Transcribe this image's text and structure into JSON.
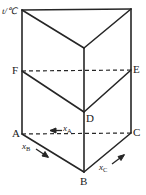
{
  "figure": {
    "name": "ternary-phase-prism",
    "type": "diagram",
    "width": 146,
    "height": 195,
    "background_color": "#ffffff",
    "line_color": "#262626",
    "text_color": "#1a1a1a"
  },
  "axis": {
    "temperature_label": "t/℃"
  },
  "vertices": {
    "A": "A",
    "B": "B",
    "C": "C",
    "D": "D",
    "E": "E",
    "F": "F"
  },
  "composition_axes": [
    {
      "id": "x-a",
      "symbol": "x",
      "subscript": "A",
      "arrow": "←",
      "arrow_direction": "left",
      "along": "C→A"
    },
    {
      "id": "x-b",
      "symbol": "x",
      "subscript": "B",
      "arrow": "↘",
      "arrow_direction": "down-right",
      "along": "A→B"
    },
    {
      "id": "x-c",
      "symbol": "x",
      "subscript": "C",
      "arrow": "↗",
      "arrow_direction": "up-right",
      "along": "B→C"
    }
  ],
  "geometry": {
    "top_left": [
      22,
      10
    ],
    "top_right": [
      131,
      9
    ],
    "top_front": [
      84,
      48
    ],
    "mid_left_F": [
      22,
      71
    ],
    "mid_right_E": [
      131,
      70
    ],
    "mid_front_D": [
      84,
      112
    ],
    "base_left_A": [
      22,
      134
    ],
    "base_right_C": [
      131,
      133
    ],
    "base_front_B": [
      84,
      172
    ]
  }
}
